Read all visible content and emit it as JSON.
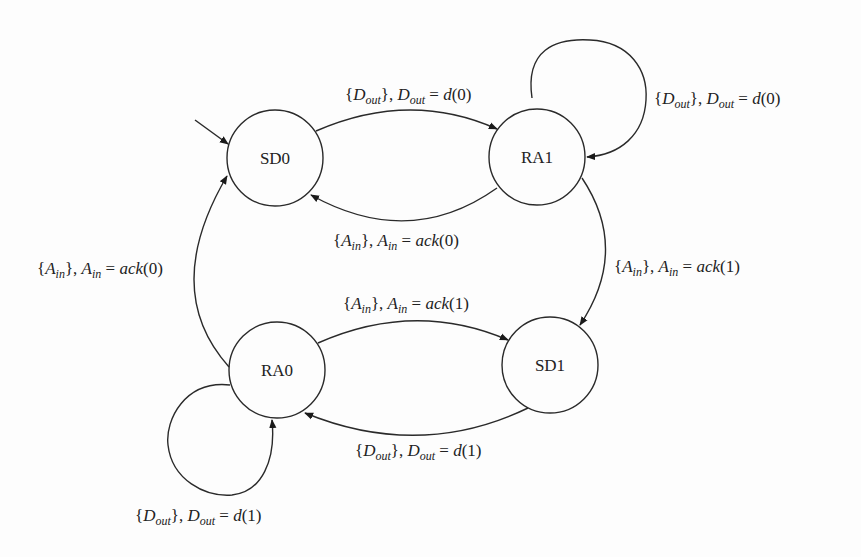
{
  "diagram": {
    "type": "state-machine",
    "initial_state": "SD0",
    "states": [
      {
        "id": "SD0",
        "label": "SD0"
      },
      {
        "id": "RA1",
        "label": "RA1"
      },
      {
        "id": "SD1",
        "label": "SD1"
      },
      {
        "id": "RA0",
        "label": "RA0"
      }
    ],
    "transitions": [
      {
        "from": "SD0",
        "to": "RA1",
        "signal": "D",
        "signal_sub": "out",
        "value": "d(0)",
        "label": "{D_out}, D_out = d(0)"
      },
      {
        "from": "RA1",
        "to": "RA1",
        "signal": "D",
        "signal_sub": "out",
        "value": "d(0)",
        "label": "{D_out}, D_out = d(0)"
      },
      {
        "from": "RA1",
        "to": "SD0",
        "signal": "A",
        "signal_sub": "in",
        "value": "ack(0)",
        "label": "{A_in}, A_in = ack(0)"
      },
      {
        "from": "RA1",
        "to": "SD1",
        "signal": "A",
        "signal_sub": "in",
        "value": "ack(1)",
        "label": "{A_in}, A_in = ack(1)"
      },
      {
        "from": "RA0",
        "to": "SD1",
        "signal": "A",
        "signal_sub": "in",
        "value": "ack(1)",
        "label": "{A_in}, A_in = ack(1)"
      },
      {
        "from": "SD1",
        "to": "RA0",
        "signal": "D",
        "signal_sub": "out",
        "value": "d(1)",
        "label": "{D_out}, D_out = d(1)"
      },
      {
        "from": "RA0",
        "to": "RA0",
        "signal": "D",
        "signal_sub": "out",
        "value": "d(1)",
        "label": "{D_out}, D_out = d(1)"
      },
      {
        "from": "RA0",
        "to": "SD0",
        "signal": "A",
        "signal_sub": "in",
        "value": "ack(0)",
        "label": "{A_in}, A_in = ack(0)"
      }
    ]
  }
}
